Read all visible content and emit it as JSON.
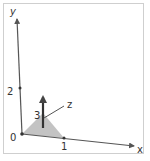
{
  "diagram": {
    "type": "3d-axes",
    "axes": {
      "x": {
        "label": "x",
        "tick_label": "1"
      },
      "y": {
        "label": "y",
        "tick_label": "2"
      },
      "z": {
        "label": "z",
        "tick_label": "3"
      }
    },
    "origin_label": "0",
    "colors": {
      "axis": "#555555",
      "shaded_triangle": "#bdbdbd",
      "vector": "#333333",
      "frame": "#cfcfcf"
    }
  }
}
